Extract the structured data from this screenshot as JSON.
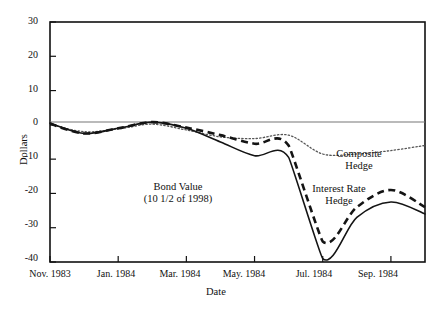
{
  "chart_data": {
    "type": "line",
    "title": "",
    "xlabel": "Date",
    "ylabel": "Dollars",
    "ylim": [
      -40,
      30
    ],
    "yticks": [
      30,
      20,
      10,
      0,
      -10,
      -20,
      -30,
      -40
    ],
    "ytick_labels": [
      "30",
      "20",
      "10",
      "0",
      "-10",
      "-20",
      "-30",
      "-40"
    ],
    "x": [
      "Nov. 1983",
      "Dec. 1983",
      "Jan. 1984",
      "Feb. 1984",
      "Mar. 1984",
      "Apr. 1984",
      "May. 1984",
      "Jun. 1984",
      "Jul. 1984",
      "Aug. 1984",
      "Sep. 1984",
      "Oct. 1984"
    ],
    "xticks": [
      0,
      2,
      4,
      6,
      8,
      10
    ],
    "xtick_labels": [
      "Nov. 1983",
      "Jan. 1984",
      "Mar. 1984",
      "May. 1984",
      "Jul. 1984",
      "Sep. 1984"
    ],
    "grid": false,
    "zero_line": true,
    "legend": "inline-annotations",
    "series": [
      {
        "name": "Bond Value (10 1/2 of 1998)",
        "style": "solid",
        "color": "#1a1a1a",
        "values": [
          0.5,
          -2.5,
          -1.0,
          0.8,
          -1.0,
          -5.0,
          -9.0,
          -9.5,
          -39.0,
          -27.0,
          -22.5,
          -26.0
        ]
      },
      {
        "name": "Interest Rate Hedge",
        "style": "dashed",
        "color": "#1a1a1a",
        "values": [
          0.3,
          -2.5,
          -1.0,
          0.8,
          -0.8,
          -3.0,
          -5.5,
          -6.0,
          -34.0,
          -24.0,
          -19.0,
          -24.0
        ]
      },
      {
        "name": "Composite Hedge",
        "style": "dotted",
        "color": "#555555",
        "values": [
          0.2,
          -2.0,
          -1.2,
          0.2,
          -1.5,
          -3.5,
          -4.0,
          -3.0,
          -8.5,
          -8.5,
          -7.5,
          -6.0
        ]
      }
    ],
    "annotations": [
      {
        "text_line1": "Bond Value",
        "text_line2": "(10 1/2 of 1998)"
      },
      {
        "text_line1": "Composite",
        "text_line2": "Hedge"
      },
      {
        "text_line1": "Interest Rate",
        "text_line2": "Hedge"
      }
    ]
  }
}
